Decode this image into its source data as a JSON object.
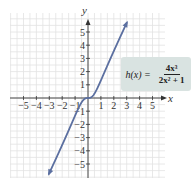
{
  "chart_data": {
    "type": "line",
    "title": "",
    "function_label": "h(x) = 4x^3 / (2x^2 + 1)",
    "function_lhs": "h(x) =",
    "function_numerator": "4x³",
    "function_denominator": "2x² + 1",
    "xlabel": "x",
    "ylabel": "y",
    "xlim": [
      -5.5,
      5.5
    ],
    "ylim": [
      -6,
      6
    ],
    "x_ticks": [
      -5,
      -4,
      -3,
      -2,
      -1,
      1,
      2,
      3,
      4,
      5
    ],
    "y_ticks": [
      -5,
      -4,
      -3,
      -2,
      -1,
      1,
      2,
      3,
      4,
      5
    ],
    "x_tick_labels": [
      "−5",
      "−4",
      "−3",
      "−2",
      "−1",
      "1",
      "2",
      "3",
      "4",
      "5"
    ],
    "y_tick_labels": [
      "−5",
      "−4",
      "−3",
      "−2",
      "−1",
      "1",
      "2",
      "3",
      "4",
      "5"
    ],
    "grid": true,
    "series": [
      {
        "name": "h(x)",
        "x": [
          -3,
          -2.5,
          -2,
          -1.5,
          -1,
          -0.5,
          0,
          0.5,
          1,
          1.5,
          2,
          2.5,
          3
        ],
        "values": [
          -5.68,
          -4.65,
          -3.56,
          -2.45,
          -1.33,
          -0.33,
          0,
          0.33,
          1.33,
          2.45,
          3.56,
          4.65,
          5.68
        ]
      }
    ],
    "colors": {
      "curve": "#5b6fa0",
      "grid": "#e2e2e2",
      "axis": "#333333",
      "callout_bg": "#d9e3e1"
    }
  }
}
